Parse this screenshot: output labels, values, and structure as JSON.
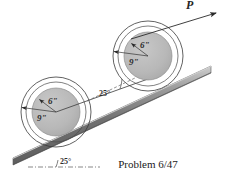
{
  "figure": {
    "caption": "Problem 6/47",
    "force_label": "P",
    "wheels": [
      {
        "name": "lower-wheel",
        "center_x": 56,
        "center_y": 112,
        "inner_radius_label": "6\"",
        "outer_radius_label": "9\"",
        "inner_radius_px": 24,
        "hub_radius_px": 30,
        "outer_radius_px": 35
      },
      {
        "name": "upper-wheel",
        "center_x": 148,
        "center_y": 56,
        "inner_radius_label": "6\"",
        "outer_radius_label": "9\"",
        "inner_radius_px": 24,
        "hub_radius_px": 30,
        "outer_radius_px": 35
      }
    ],
    "angles": [
      {
        "name": "incline-angle-upper",
        "value": "25°",
        "x": 105,
        "y": 93
      },
      {
        "name": "incline-angle-lower",
        "value": "25°",
        "x": 66,
        "y": 161
      }
    ],
    "colors": {
      "disk_fill": "#b9b9b9",
      "hub_fill": "#f2f2f2",
      "ramp_dark": "#6e6e6e",
      "ramp_light": "#c9c9c9",
      "stroke": "#3a3a3a",
      "text": "#1a1a1a",
      "background": "#ffffff"
    }
  }
}
